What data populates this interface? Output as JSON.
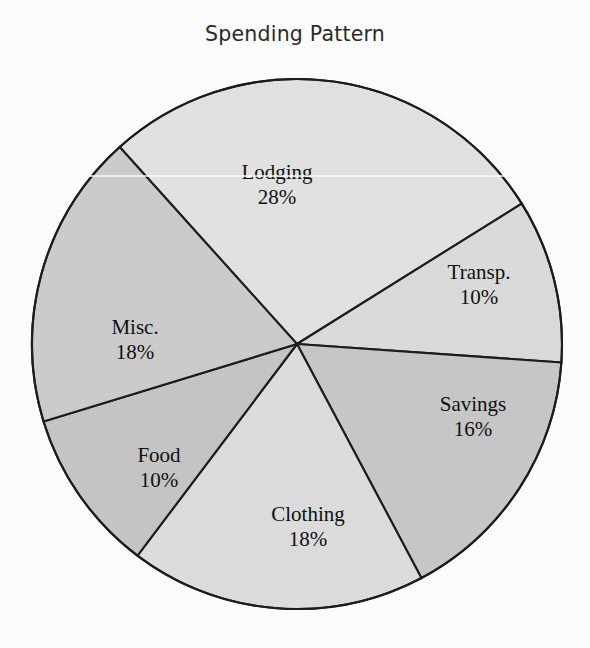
{
  "chart_data": {
    "type": "pie",
    "title": "Spending Pattern",
    "xlabel": "",
    "ylabel": "",
    "legend": "none",
    "grid": false,
    "units": "%",
    "labels_inside_slices": true,
    "categories": [
      "Lodging",
      "Transp.",
      "Savings",
      "Clothing",
      "Food",
      "Misc."
    ],
    "values": [
      28,
      10,
      16,
      18,
      10,
      18
    ],
    "value_labels": [
      "28%",
      "10%",
      "16%",
      "18%",
      "10%",
      "18%"
    ],
    "total": 100,
    "start_angle_deg": 318,
    "direction": "clockwise",
    "slices": [
      {
        "name": "Lodging",
        "value": 28,
        "value_label": "28%",
        "color": "#e3e3e3",
        "start_deg": 318,
        "end_deg": 418,
        "label_x": 277,
        "label_y": 185
      },
      {
        "name": "Transp.",
        "value": 10,
        "value_label": "10%",
        "color": "#dcdcdc",
        "start_deg": 58,
        "end_deg": 94,
        "label_x": 479,
        "label_y": 285
      },
      {
        "name": "Savings",
        "value": 16,
        "value_label": "16%",
        "color": "#c8c8c8",
        "start_deg": 94,
        "end_deg": 152,
        "label_x": 473,
        "label_y": 417
      },
      {
        "name": "Clothing",
        "value": 18,
        "value_label": "18%",
        "color": "#dedede",
        "start_deg": 152,
        "end_deg": 217,
        "label_x": 308,
        "label_y": 527
      },
      {
        "name": "Food",
        "value": 10,
        "value_label": "10%",
        "color": "#c6c6c6",
        "start_deg": 217,
        "end_deg": 253,
        "label_x": 159,
        "label_y": 468
      },
      {
        "name": "Misc.",
        "value": 18,
        "value_label": "18%",
        "color": "#cdcdcd",
        "start_deg": 253,
        "end_deg": 318,
        "label_x": 135,
        "label_y": 340
      }
    ],
    "geometry": {
      "center_x": 297,
      "center_y": 344,
      "radius": 265,
      "stroke_color": "#1d1d1d",
      "stroke_width": 2.1
    },
    "colors": {
      "background": "#fefefe",
      "title": "#2b2b2b",
      "label_text": "#111111",
      "outline": "#1d1d1d"
    }
  }
}
